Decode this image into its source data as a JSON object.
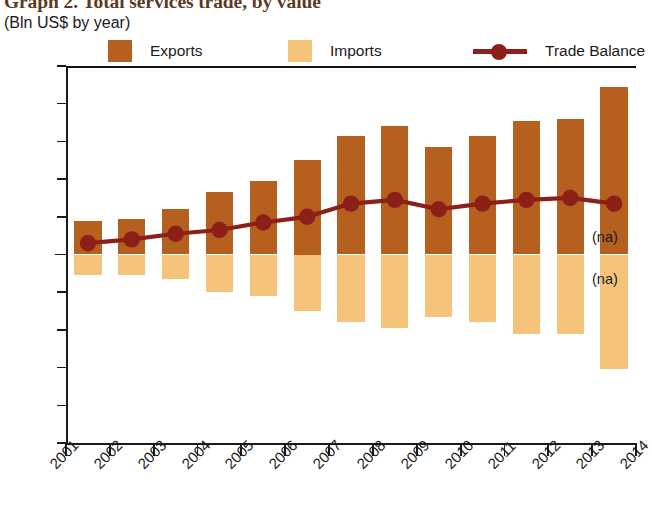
{
  "title": {
    "main": "Graph 2. Total services trade, by value",
    "sub": "(Bln US$ by year)"
  },
  "legend": {
    "items": [
      {
        "label": "Exports",
        "type": "swatch",
        "color": "#B5601F"
      },
      {
        "label": "Imports",
        "type": "swatch",
        "color": "#F5C379"
      },
      {
        "label": "Trade Balance",
        "type": "line",
        "color": "#8C1F18"
      }
    ]
  },
  "annotations": [
    {
      "text": "(na)",
      "x": 2014.5,
      "y": 8
    },
    {
      "text": "(na)",
      "x": 2014.5,
      "y": -14
    }
  ],
  "colors": {
    "exports": "#B5601F",
    "imports": "#F5C379",
    "balance": "#8C1F18",
    "axis": "#1a1a1a",
    "background": "#ffffff"
  },
  "chart_data": {
    "type": "bar",
    "title": "Graph 2. Total services trade, by value",
    "subtitle": "(Bln US$ by year)",
    "xlabel": "",
    "ylabel": "Bln US$",
    "ylim": [
      -100,
      100
    ],
    "yticks": [
      100,
      80,
      60,
      40,
      20,
      0,
      -20,
      -40,
      -60,
      -80,
      -100
    ],
    "ytick_labels": [
      "100",
      "80",
      "60",
      "40",
      "20",
      "0",
      "−20",
      "−40",
      "−60",
      "−80",
      "−100"
    ],
    "xticks": [
      2001,
      2002,
      2003,
      2004,
      2005,
      2006,
      2007,
      2008,
      2009,
      2010,
      2011,
      2012,
      2013,
      2014
    ],
    "xtick_labels": [
      "2001",
      "2002",
      "2003",
      "2004",
      "2005",
      "2006",
      "2007",
      "2008",
      "2009",
      "2010",
      "2011",
      "2012",
      "2013",
      "2014"
    ],
    "categories": [
      "2001",
      "2002",
      "2003",
      "2004",
      "2005",
      "2006",
      "2007",
      "2008",
      "2009",
      "2010",
      "2011",
      "2012",
      "2013"
    ],
    "grid": false,
    "legend_position": "top",
    "series": [
      {
        "name": "Exports",
        "type": "bar",
        "color": "#B5601F",
        "values": [
          18,
          19,
          24,
          33,
          39,
          50,
          63,
          68,
          57,
          63,
          71,
          72,
          89
        ]
      },
      {
        "name": "Imports",
        "type": "bar",
        "color": "#F5C379",
        "values": [
          -11,
          -11,
          -13,
          -20,
          -22,
          -30,
          -36,
          -39,
          -33,
          -36,
          -42,
          -42,
          -61
        ]
      },
      {
        "name": "Trade Balance",
        "type": "line",
        "color": "#8C1F18",
        "values": [
          6,
          8,
          11,
          13,
          17,
          20,
          27,
          29,
          24,
          27,
          29,
          30,
          27
        ]
      }
    ]
  }
}
